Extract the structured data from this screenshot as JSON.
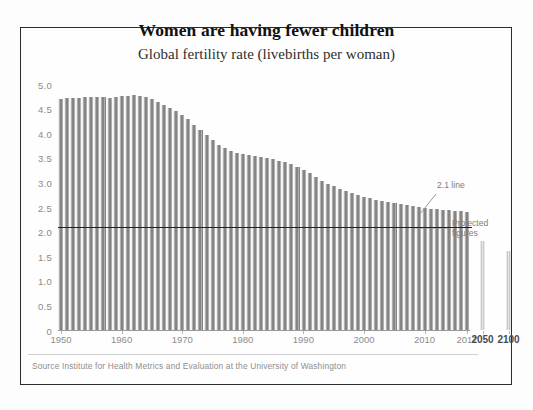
{
  "chart_data": {
    "type": "bar",
    "title": "Women are having fewer children",
    "subtitle": "Global fertility rate (livebirths per woman)",
    "xlabel": "",
    "ylabel": "",
    "ylim": [
      0,
      5.0
    ],
    "grid": false,
    "legend_position": "none",
    "ytick_labels": [
      "5.0",
      "4.5",
      "4.0",
      "3.5",
      "3.0",
      "2.5",
      "2.0",
      "1.5",
      "1.0",
      "0.5",
      "0"
    ],
    "ytick_values": [
      5.0,
      4.5,
      4.0,
      3.5,
      3.0,
      2.5,
      2.0,
      1.5,
      1.0,
      0.5,
      0
    ],
    "xtick_labels": [
      "1950",
      "1960",
      "1970",
      "1980",
      "1990",
      "2000",
      "2010",
      "2017"
    ],
    "xtick_values": [
      1950,
      1960,
      1970,
      1980,
      1990,
      2000,
      2010,
      2017
    ],
    "projection_tick_labels": [
      "2050",
      "2100"
    ],
    "categories": [
      1950,
      1951,
      1952,
      1953,
      1954,
      1955,
      1956,
      1957,
      1958,
      1959,
      1960,
      1961,
      1962,
      1963,
      1964,
      1965,
      1966,
      1967,
      1968,
      1969,
      1970,
      1971,
      1972,
      1973,
      1974,
      1975,
      1976,
      1977,
      1978,
      1979,
      1980,
      1981,
      1982,
      1983,
      1984,
      1985,
      1986,
      1987,
      1988,
      1989,
      1990,
      1991,
      1992,
      1993,
      1994,
      1995,
      1996,
      1997,
      1998,
      1999,
      2000,
      2001,
      2002,
      2003,
      2004,
      2005,
      2006,
      2007,
      2008,
      2009,
      2010,
      2011,
      2012,
      2013,
      2014,
      2015,
      2016,
      2017
    ],
    "values": [
      4.7,
      4.71,
      4.72,
      4.72,
      4.73,
      4.73,
      4.74,
      4.74,
      4.72,
      4.74,
      4.75,
      4.76,
      4.77,
      4.76,
      4.74,
      4.7,
      4.64,
      4.58,
      4.52,
      4.46,
      4.38,
      4.28,
      4.17,
      4.06,
      3.96,
      3.86,
      3.77,
      3.7,
      3.64,
      3.6,
      3.57,
      3.55,
      3.53,
      3.52,
      3.5,
      3.47,
      3.44,
      3.41,
      3.37,
      3.32,
      3.26,
      3.19,
      3.11,
      3.03,
      2.97,
      2.92,
      2.87,
      2.83,
      2.79,
      2.75,
      2.71,
      2.68,
      2.65,
      2.62,
      2.6,
      2.58,
      2.56,
      2.54,
      2.52,
      2.5,
      2.48,
      2.46,
      2.45,
      2.44,
      2.43,
      2.42,
      2.41,
      2.4
    ],
    "projection_categories": [
      2050,
      2100
    ],
    "projection_values": [
      1.8,
      1.6
    ],
    "reference_line": {
      "value": 2.1,
      "label": "2.1 line"
    },
    "annotations": [
      {
        "text": "2.1 line"
      },
      {
        "text": "Projected figures"
      }
    ],
    "series_color": "#8d8d8d",
    "projection_color": "#d2d2d2",
    "reference_line_color": "#1f1f1f"
  },
  "annotations": {
    "two_one_line": "2.1 line",
    "projected_figures": "Projected figures"
  },
  "source": {
    "text": "Source  Institute for Health Metrics and Evaluation at the University of Washington"
  }
}
